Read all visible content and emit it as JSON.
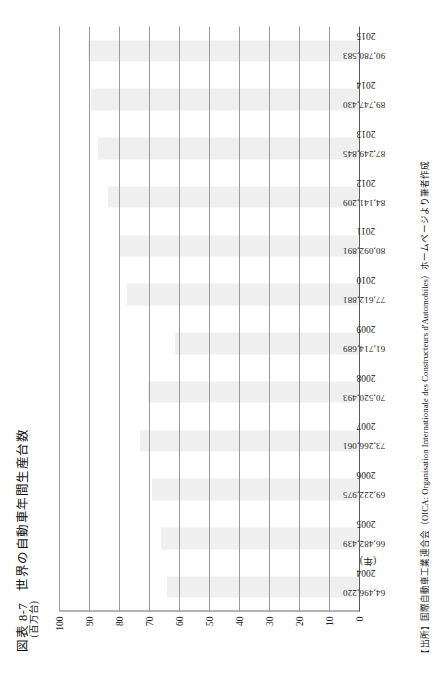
{
  "figure": {
    "number": "図表 8-7",
    "title": "世界の自動車年間生産台数",
    "x_axis_caption": "(年)",
    "y_axis_unit": "(百万台)",
    "source": "【出所】国際自動車工業連合会（OICA: Organisation Internationale des Constructeurs d'Automobiles）ホームページより筆者作成"
  },
  "chart_data": {
    "type": "bar",
    "title": "世界の自動車年間生産台数",
    "xlabel": "(年)",
    "ylabel": "(百万台)",
    "ylim": [
      0,
      100
    ],
    "yticks": [
      "0",
      "10",
      "20",
      "30",
      "40",
      "50",
      "60",
      "70",
      "80",
      "90",
      "100"
    ],
    "ytick_values": [
      0,
      10,
      20,
      30,
      40,
      50,
      60,
      70,
      80,
      90,
      100
    ],
    "grid": true,
    "legend": "none",
    "units_note": "values in vehicles; axis in millions of vehicles",
    "categories": [
      "2004",
      "2005",
      "2006",
      "2007",
      "2008",
      "2009",
      "2010",
      "2011",
      "2012",
      "2013",
      "2014",
      "2015"
    ],
    "values": [
      64496220,
      66482439,
      69222975,
      73266061,
      70520493,
      61714689,
      77612881,
      80092891,
      84141209,
      87249845,
      89747430,
      90780583
    ],
    "value_labels": [
      "64,496,220",
      "66,482,439",
      "69,222,975",
      "73,266,061",
      "70,520,493",
      "61,714,689",
      "77,612,881",
      "80,092,891",
      "84,141,209",
      "87,249,845",
      "89,747,430",
      "90,780,583"
    ],
    "bar_color": "#efefef"
  }
}
